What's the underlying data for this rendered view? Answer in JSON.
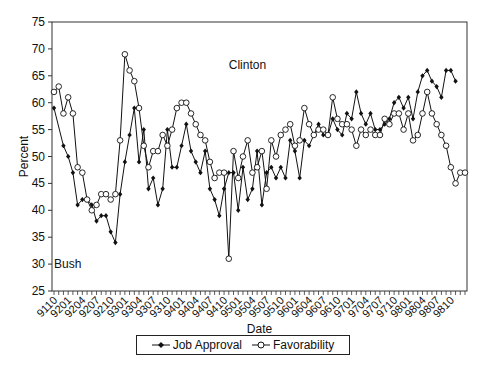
{
  "chart_data": {
    "type": "line",
    "title": "",
    "xlabel": "Date",
    "ylabel": "Percent",
    "ylim": [
      25,
      75
    ],
    "yticks": [
      25,
      30,
      35,
      40,
      45,
      50,
      55,
      60,
      65,
      70,
      75
    ],
    "xtick_labels": [
      "9110",
      "9201",
      "9204",
      "9207",
      "9210",
      "9301",
      "9304",
      "9307",
      "9310",
      "9401",
      "9404",
      "9407",
      "9410",
      "9501",
      "9504",
      "9507",
      "9510",
      "9601",
      "9604",
      "9607",
      "9610",
      "9701",
      "9704",
      "9707",
      "9710",
      "9801",
      "9804",
      "9807",
      "9810"
    ],
    "x_months": 85,
    "grid": false,
    "legend_position": "bottom",
    "annotations": [
      {
        "text": "Bush",
        "x_index": 0,
        "y": 30
      },
      {
        "text": "Clinton",
        "x_index": 37,
        "y": 67
      }
    ],
    "series": [
      {
        "name": "Job Approval",
        "marker": "filled-diamond",
        "points": [
          [
            0,
            59
          ],
          [
            2,
            52
          ],
          [
            3,
            50
          ],
          [
            4,
            47
          ],
          [
            5,
            41
          ],
          [
            6,
            42
          ],
          [
            7,
            42
          ],
          [
            8,
            41
          ],
          [
            9,
            38
          ],
          [
            10,
            39
          ],
          [
            11,
            39
          ],
          [
            12,
            36
          ],
          [
            13,
            34
          ],
          [
            14,
            43
          ],
          [
            15,
            49
          ],
          [
            16,
            54
          ],
          [
            17,
            59
          ],
          [
            18,
            49
          ],
          [
            19,
            55
          ],
          [
            20,
            44
          ],
          [
            21,
            46
          ],
          [
            22,
            41
          ],
          [
            23,
            44
          ],
          [
            24,
            55
          ],
          [
            25,
            48
          ],
          [
            26,
            48
          ],
          [
            27,
            52
          ],
          [
            28,
            56
          ],
          [
            29,
            51
          ],
          [
            30,
            49
          ],
          [
            31,
            47
          ],
          [
            32,
            51
          ],
          [
            33,
            44
          ],
          [
            34,
            42
          ],
          [
            35,
            39
          ],
          [
            36,
            44
          ],
          [
            37,
            47
          ],
          [
            38,
            47
          ],
          [
            39,
            40
          ],
          [
            40,
            48
          ],
          [
            41,
            42
          ],
          [
            42,
            44
          ],
          [
            43,
            51
          ],
          [
            44,
            41
          ],
          [
            45,
            47
          ],
          [
            46,
            48
          ],
          [
            47,
            46
          ],
          [
            48,
            48
          ],
          [
            49,
            46
          ],
          [
            50,
            53
          ],
          [
            51,
            51
          ],
          [
            52,
            46
          ],
          [
            53,
            53
          ],
          [
            54,
            52
          ],
          [
            55,
            54
          ],
          [
            56,
            56
          ],
          [
            57,
            54
          ],
          [
            58,
            54
          ],
          [
            59,
            57
          ],
          [
            60,
            55
          ],
          [
            61,
            54
          ],
          [
            62,
            58
          ],
          [
            63,
            57
          ],
          [
            64,
            62
          ],
          [
            65,
            58
          ],
          [
            66,
            56
          ],
          [
            67,
            58
          ],
          [
            68,
            55
          ],
          [
            69,
            55
          ],
          [
            70,
            56
          ],
          [
            71,
            57
          ],
          [
            72,
            60
          ],
          [
            73,
            61
          ],
          [
            74,
            59
          ],
          [
            75,
            61
          ],
          [
            76,
            57
          ],
          [
            77,
            62
          ],
          [
            78,
            65
          ],
          [
            79,
            66
          ],
          [
            80,
            64
          ],
          [
            81,
            63
          ],
          [
            82,
            61
          ],
          [
            83,
            66
          ],
          [
            84,
            66
          ],
          [
            85,
            64
          ]
        ]
      },
      {
        "name": "Favorability",
        "marker": "open-circle",
        "points": [
          [
            0,
            62
          ],
          [
            1,
            63
          ],
          [
            2,
            58
          ],
          [
            3,
            61
          ],
          [
            4,
            58
          ],
          [
            5,
            48
          ],
          [
            6,
            47
          ],
          [
            7,
            42
          ],
          [
            8,
            40
          ],
          [
            9,
            41
          ],
          [
            10,
            43
          ],
          [
            11,
            43
          ],
          [
            12,
            42
          ],
          [
            13,
            43
          ],
          [
            14,
            53
          ],
          [
            15,
            69
          ],
          [
            16,
            66
          ],
          [
            17,
            64
          ],
          [
            18,
            59
          ],
          [
            19,
            52
          ],
          [
            20,
            48
          ],
          [
            21,
            51
          ],
          [
            22,
            51
          ],
          [
            23,
            54
          ],
          [
            24,
            52
          ],
          [
            25,
            55
          ],
          [
            26,
            59
          ],
          [
            27,
            60
          ],
          [
            28,
            60
          ],
          [
            29,
            58
          ],
          [
            30,
            56
          ],
          [
            31,
            54
          ],
          [
            32,
            53
          ],
          [
            33,
            49
          ],
          [
            34,
            46
          ],
          [
            35,
            47
          ],
          [
            36,
            47
          ],
          [
            37,
            31
          ],
          [
            38,
            51
          ],
          [
            39,
            46
          ],
          [
            40,
            50
          ],
          [
            41,
            53
          ],
          [
            42,
            47
          ],
          [
            43,
            48
          ],
          [
            44,
            51
          ],
          [
            45,
            44
          ],
          [
            46,
            53
          ],
          [
            47,
            50
          ],
          [
            48,
            54
          ],
          [
            49,
            55
          ],
          [
            50,
            56
          ],
          [
            51,
            52
          ],
          [
            52,
            53
          ],
          [
            53,
            59
          ],
          [
            54,
            56
          ],
          [
            55,
            54
          ],
          [
            56,
            55
          ],
          [
            57,
            55
          ],
          [
            58,
            54
          ],
          [
            59,
            61
          ],
          [
            60,
            57
          ],
          [
            61,
            56
          ],
          [
            62,
            56
          ],
          [
            63,
            55
          ],
          [
            64,
            52
          ],
          [
            65,
            55
          ],
          [
            66,
            54
          ],
          [
            67,
            55
          ],
          [
            68,
            54
          ],
          [
            69,
            54
          ],
          [
            70,
            57
          ],
          [
            71,
            56
          ],
          [
            72,
            58
          ],
          [
            73,
            58
          ],
          [
            74,
            55
          ],
          [
            75,
            58
          ],
          [
            76,
            53
          ],
          [
            77,
            54
          ],
          [
            78,
            58
          ],
          [
            79,
            62
          ],
          [
            80,
            58
          ],
          [
            81,
            56
          ],
          [
            82,
            54
          ],
          [
            83,
            52
          ],
          [
            84,
            48
          ],
          [
            85,
            45
          ],
          [
            86,
            47
          ],
          [
            87,
            47
          ]
        ]
      }
    ]
  },
  "legend": {
    "items": [
      {
        "label": "Job Approval",
        "marker": "filled-diamond"
      },
      {
        "label": "Favorability",
        "marker": "open-circle"
      }
    ]
  }
}
